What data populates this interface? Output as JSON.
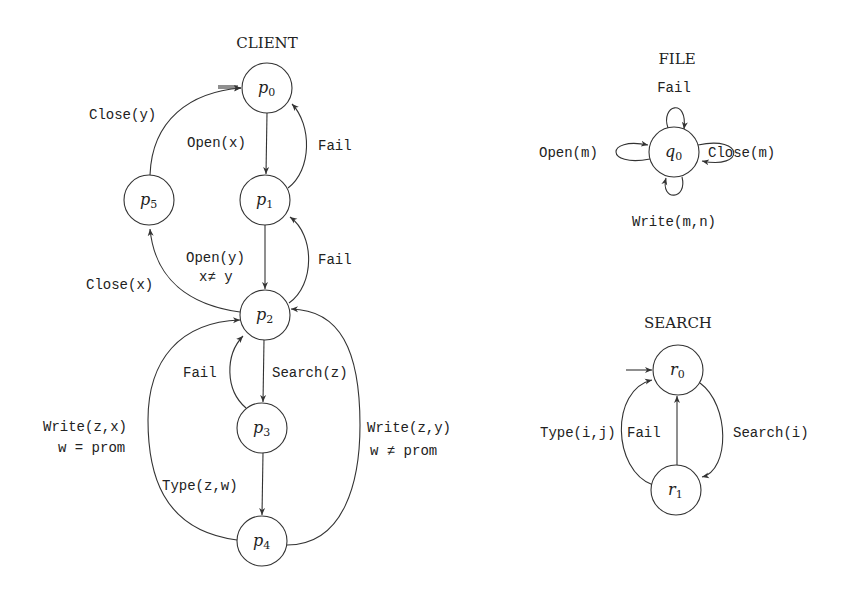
{
  "diagram": {
    "client": {
      "title": "CLIENT",
      "nodes": [
        {
          "id": "p0",
          "base": "p",
          "sub": "0",
          "initial": true
        },
        {
          "id": "p1",
          "base": "p",
          "sub": "1"
        },
        {
          "id": "p2",
          "base": "p",
          "sub": "2"
        },
        {
          "id": "p3",
          "base": "p",
          "sub": "3"
        },
        {
          "id": "p4",
          "base": "p",
          "sub": "4"
        },
        {
          "id": "p5",
          "base": "p",
          "sub": "5"
        }
      ],
      "edges": {
        "p0_p1": "Open(x)",
        "p1_p0": "Fail",
        "p1_p2_line1": "Open(y)",
        "p1_p2_line2": "x≠ y",
        "p2_p1": "Fail",
        "p2_p5": "Close(x)",
        "p5_p0": "Close(y)",
        "p2_p3": "Search(z)",
        "p3_p2": "Fail",
        "p3_p4": "Type(z,w)",
        "p4_p2_left_line1": "Write(z,x)",
        "p4_p2_left_line2": "w = prom",
        "p4_p2_right_line1": "Write(z,y)",
        "p4_p2_right_line2": "w ≠ prom"
      }
    },
    "file": {
      "title": "FILE",
      "nodes": [
        {
          "id": "q0",
          "base": "q",
          "sub": "0"
        }
      ],
      "edges": {
        "self_top": "Fail",
        "self_left": "Open(m)",
        "self_right": "Close(m)",
        "self_bottom": "Write(m,n)"
      }
    },
    "search": {
      "title": "SEARCH",
      "nodes": [
        {
          "id": "r0",
          "base": "r",
          "sub": "0",
          "initial": true
        },
        {
          "id": "r1",
          "base": "r",
          "sub": "1"
        }
      ],
      "edges": {
        "r0_r1": "Search(i)",
        "r1_r0_fail": "Fail",
        "r1_r0_type": "Type(i,j)"
      }
    }
  }
}
